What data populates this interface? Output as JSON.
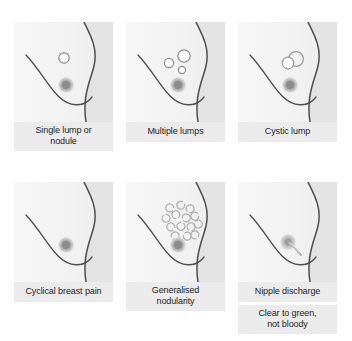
{
  "figure": {
    "rows": 2,
    "columns": 3,
    "colors": {
      "panel_background_light": "#f5f5f5",
      "panel_background_shade": "#e0e0e0",
      "caption_background": "#ebebeb",
      "outline": "#4d4d4d",
      "lump_outline": "#8c8c8c",
      "areola": "#9a9a9a",
      "text": "#231f20"
    },
    "panels": [
      {
        "id": "single-lump",
        "caption": "Single lump or",
        "caption_line2": "nodule",
        "feature": "one small open circle above the areola",
        "lump_count": 1
      },
      {
        "id": "multiple-lumps",
        "caption": "Multiple lumps",
        "caption_line2": "",
        "feature": "three open circles of differing size above the areola",
        "lump_count": 3
      },
      {
        "id": "cystic-lump",
        "caption": "Cystic lump",
        "caption_line2": "",
        "feature": "two overlapping circles, one filled white",
        "lump_count": 2
      },
      {
        "id": "cyclical-breast-pain",
        "caption": "Cyclical breast pain",
        "caption_line2": "",
        "feature": "no lumps shown, plain breast outline",
        "lump_count": 0
      },
      {
        "id": "generalised-nodularity",
        "caption": "Generalised",
        "caption_line2": "nodularity",
        "feature": "many small C-shaped arcs scattered in upper breast",
        "lump_count": 14
      },
      {
        "id": "nipple-discharge",
        "caption": "Nipple discharge",
        "caption_line2": "",
        "secondary_caption": "Clear to green,",
        "secondary_caption_line2": "not bloody",
        "feature": "fluid stream emerging from the nipple",
        "lump_count": 0
      }
    ]
  }
}
